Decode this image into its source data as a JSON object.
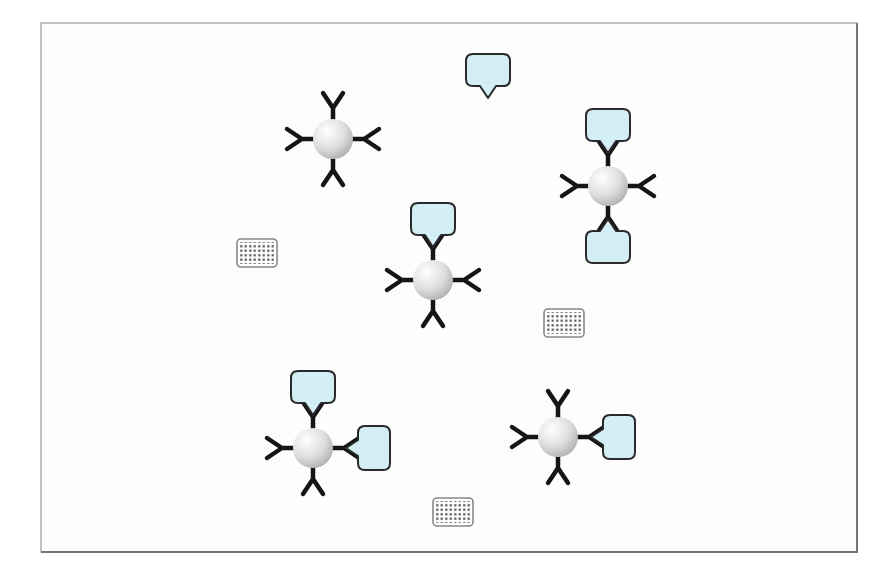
{
  "canvas": {
    "width": 889,
    "height": 580,
    "background": "#ffffff"
  },
  "frame": {
    "x": 41,
    "y": 23,
    "width": 816,
    "height": 529,
    "fill": "#fdfdfd",
    "border_color": "#9a9a9a",
    "shadow_color": "#757575"
  },
  "colors": {
    "antibody": "#151515",
    "antigen_fill": "#d4eef6",
    "antigen_stroke": "#2a2a2a",
    "bead_highlight": "#ffffff",
    "bead_mid": "#dedede",
    "bead_edge": "#a9a9a9",
    "chip_fill": "#ffffff",
    "chip_stroke": "#888888",
    "chip_dot": "#4d4d4d"
  },
  "geometry": {
    "bead_radius": 20,
    "arm_stem": 31,
    "arm_prong_dx": 10,
    "arm_prong_dy": 15,
    "arm_stroke_width": 4.5,
    "antigen_width": 44,
    "antigen_height": 32,
    "antigen_corner_radius": 7,
    "antigen_pointer_width": 16,
    "antigen_pointer_height": 12,
    "antigen_stroke_width": 2,
    "antigen_offset": 61,
    "chip_width": 40,
    "chip_height": 28,
    "chip_corner_radius": 4,
    "chip_dot_pitch": 4.5,
    "chip_dot_size": 2.2
  },
  "complexes": [
    {
      "id": "complex-top-left",
      "x": 333,
      "y": 139,
      "rotation": 0,
      "arms": [
        {
          "dir": "up",
          "bound": false
        },
        {
          "dir": "right",
          "bound": false
        },
        {
          "dir": "down",
          "bound": false
        },
        {
          "dir": "left",
          "bound": false
        }
      ]
    },
    {
      "id": "complex-top-right",
      "x": 608,
      "y": 186,
      "rotation": 0,
      "arms": [
        {
          "dir": "up",
          "bound": true
        },
        {
          "dir": "right",
          "bound": false
        },
        {
          "dir": "down",
          "bound": true
        },
        {
          "dir": "left",
          "bound": false
        }
      ]
    },
    {
      "id": "complex-center",
      "x": 433,
      "y": 280,
      "rotation": 0,
      "arms": [
        {
          "dir": "up",
          "bound": true
        },
        {
          "dir": "right",
          "bound": false
        },
        {
          "dir": "down",
          "bound": false
        },
        {
          "dir": "left",
          "bound": false
        }
      ]
    },
    {
      "id": "complex-bottom-left",
      "x": 313,
      "y": 448,
      "rotation": 0,
      "arms": [
        {
          "dir": "up",
          "bound": true
        },
        {
          "dir": "right",
          "bound": true
        },
        {
          "dir": "down",
          "bound": false
        },
        {
          "dir": "left",
          "bound": false
        }
      ]
    },
    {
      "id": "complex-bottom-right",
      "x": 558,
      "y": 437,
      "rotation": 0,
      "arms": [
        {
          "dir": "up",
          "bound": false
        },
        {
          "dir": "right",
          "bound": true
        },
        {
          "dir": "down",
          "bound": false
        },
        {
          "dir": "left",
          "bound": false
        }
      ]
    }
  ],
  "free_antigens": [
    {
      "id": "antigen-free-top",
      "x": 488,
      "y": 70,
      "rotation": 0
    }
  ],
  "chips": [
    {
      "id": "chip-left",
      "x": 257,
      "y": 253
    },
    {
      "id": "chip-middle",
      "x": 564,
      "y": 323
    },
    {
      "id": "chip-bottom",
      "x": 453,
      "y": 512
    }
  ]
}
